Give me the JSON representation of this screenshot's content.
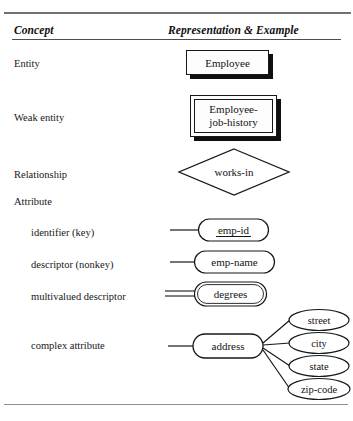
{
  "table": {
    "headers": {
      "concept": "Concept",
      "representation": "Representation & Example"
    },
    "rows": [
      {
        "concept": "Entity",
        "example": "Employee",
        "shape": "rectangle-shadow"
      },
      {
        "concept": "Weak entity",
        "example": "Employee-\njob-history",
        "shape": "double-rectangle-shadow"
      },
      {
        "concept": "Relationship",
        "example": "works-in",
        "shape": "diamond"
      },
      {
        "concept": "Attribute",
        "example": "",
        "shape": "none"
      },
      {
        "concept": "identifier (key)",
        "example": "emp-id",
        "shape": "ellipse-underlined"
      },
      {
        "concept": "descriptor (nonkey)",
        "example": "emp-name",
        "shape": "ellipse"
      },
      {
        "concept": "multivalued descriptor",
        "example": "degrees",
        "shape": "ellipse-double-line"
      },
      {
        "concept": "complex attribute",
        "example": "address",
        "shape": "ellipse-composite"
      }
    ]
  },
  "complex_attribute": {
    "parent": "address",
    "children": [
      "street",
      "city",
      "state",
      "zip-code"
    ]
  },
  "colors": {
    "ink": "#131313",
    "rule": "#555a5e",
    "paper": "#ffffff",
    "shadow": "#0f0f0f"
  }
}
